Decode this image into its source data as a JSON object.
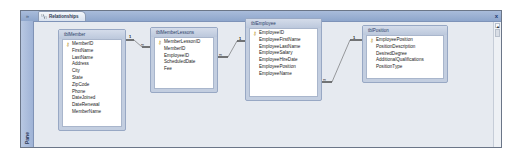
{
  "window": {
    "tab_label": "Relationships",
    "pane_label": "Pane",
    "pane_toggle": "»",
    "close_label": "x"
  },
  "tables": [
    {
      "name": "tblMember",
      "fields": [
        {
          "name": "MemberID",
          "key": true
        },
        {
          "name": "FirstName",
          "key": false
        },
        {
          "name": "LastName",
          "key": false
        },
        {
          "name": "Address",
          "key": false
        },
        {
          "name": "City",
          "key": false
        },
        {
          "name": "State",
          "key": false
        },
        {
          "name": "ZipCode",
          "key": false
        },
        {
          "name": "Phone",
          "key": false
        },
        {
          "name": "DateJoined",
          "key": false
        },
        {
          "name": "DateRenewal",
          "key": false
        },
        {
          "name": "MemberName",
          "key": false
        }
      ]
    },
    {
      "name": "tblMemberLessons",
      "fields": [
        {
          "name": "MemberLessonID",
          "key": true
        },
        {
          "name": "MemberID",
          "key": false
        },
        {
          "name": "EmployeeID",
          "key": false
        },
        {
          "name": "ScheduledDate",
          "key": false
        },
        {
          "name": "Fee",
          "key": false
        }
      ]
    },
    {
      "name": "tblEmployee",
      "fields": [
        {
          "name": "EmployeeID",
          "key": true
        },
        {
          "name": "EmployeeFirstName",
          "key": false
        },
        {
          "name": "EmployeeLastName",
          "key": false
        },
        {
          "name": "EmployeeSalary",
          "key": false
        },
        {
          "name": "EmployeeHireDate",
          "key": false
        },
        {
          "name": "EmployeePosition",
          "key": false
        },
        {
          "name": "EmployeeName",
          "key": false
        }
      ]
    },
    {
      "name": "tblPosition",
      "fields": [
        {
          "name": "EmployeePosition",
          "key": true
        },
        {
          "name": "PositionDescription",
          "key": false
        },
        {
          "name": "DesiredDegree",
          "key": false
        },
        {
          "name": "AdditionalQualifications",
          "key": false
        },
        {
          "name": "PositionType",
          "key": false
        }
      ]
    }
  ],
  "relationships": [
    {
      "from": "tblMember.MemberID",
      "to": "tblMemberLessons.MemberID",
      "one_label": "1",
      "many_label": "∞"
    },
    {
      "from": "tblEmployee.EmployeeID",
      "to": "tblMemberLessons.EmployeeID",
      "one_label": "1",
      "many_label": "∞"
    },
    {
      "from": "tblPosition.EmployeePosition",
      "to": "tblEmployee.EmployeePosition",
      "one_label": "1",
      "many_label": "∞"
    }
  ]
}
